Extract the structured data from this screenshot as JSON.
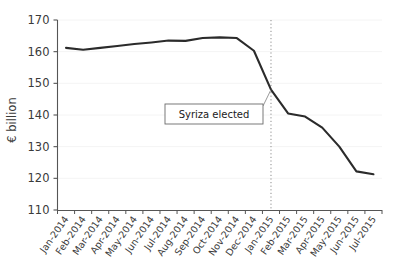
{
  "chart_data": {
    "type": "line",
    "title": "",
    "xlabel": "",
    "ylabel": "€ billion",
    "ylim": [
      110,
      170
    ],
    "yticks": [
      110,
      120,
      130,
      140,
      150,
      160,
      170
    ],
    "ytick_labels": [
      "110",
      "120",
      "130",
      "140",
      "150",
      "160",
      "170"
    ],
    "grid": true,
    "legend": "none",
    "categories": [
      "Jan-2014",
      "Feb-2014",
      "Mar-2014",
      "Apr-2014",
      "May-2014",
      "Jun-2014",
      "Jul-2014",
      "Aug-2014",
      "Sep-2014",
      "Oct-2014",
      "Nov-2014",
      "Dec-2014",
      "Jan-2015",
      "Feb-2015",
      "Mar-2015",
      "Apr-2015",
      "May-2015",
      "Jun-2015",
      "Jul-2015"
    ],
    "series": [
      {
        "name": "Greek bank deposits",
        "color": "#2b2b2b",
        "values": [
          161.2,
          160.6,
          161.2,
          161.8,
          162.4,
          162.9,
          163.5,
          163.4,
          164.3,
          164.5,
          164.3,
          160.3,
          148.0,
          140.5,
          139.5,
          136.0,
          130.0,
          122.2,
          121.3
        ]
      }
    ],
    "annotations": [
      {
        "text": "Syriza elected",
        "target_category": "Jan-2015",
        "target_value": 148.0,
        "vline_category": "Jan-2015",
        "vline_style": "dotted"
      }
    ]
  }
}
